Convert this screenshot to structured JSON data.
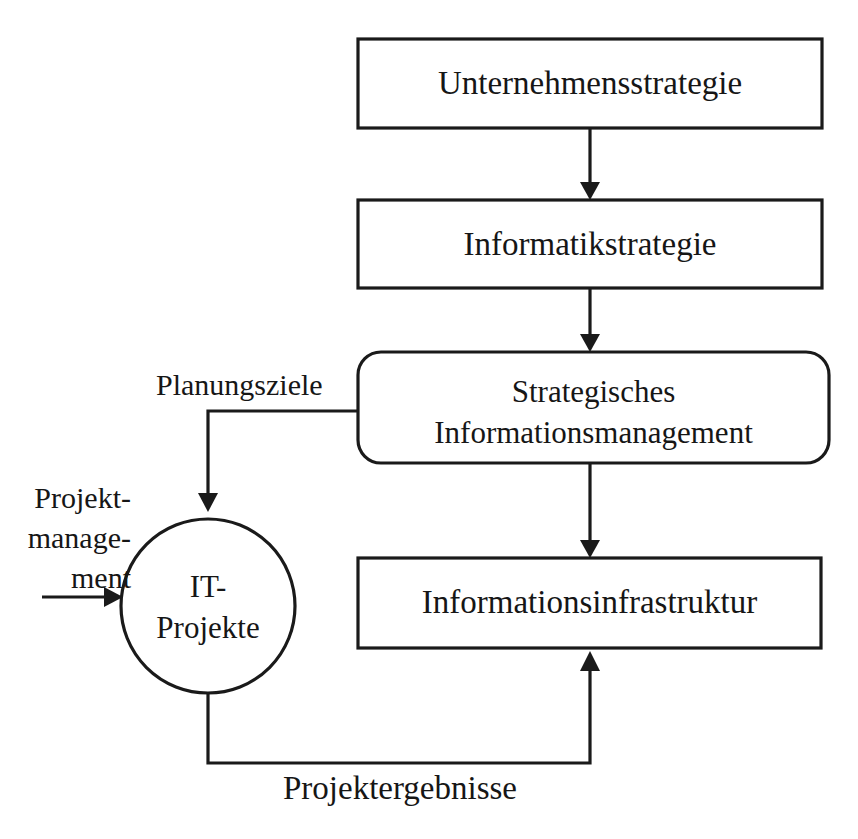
{
  "diagram": {
    "stroke_color": "#1a1a1a",
    "background_color": "#ffffff",
    "text_color": "#161616",
    "nodes": [
      {
        "id": "unternehmensstrategie",
        "shape": "rectangle",
        "label": "Unternehmensstrategie",
        "x": 358,
        "y": 39,
        "w": 464,
        "h": 89
      },
      {
        "id": "informatikstrategie",
        "shape": "rectangle",
        "label": "Informatikstrategie",
        "x": 358,
        "y": 200,
        "w": 464,
        "h": 88
      },
      {
        "id": "strategisches-informationsmanagement",
        "shape": "rounded-rectangle",
        "label_line1": "Strategisches",
        "label_line2": "Informationsmanagement",
        "x": 358,
        "y": 352,
        "w": 471,
        "h": 111
      },
      {
        "id": "informationsinfrastruktur",
        "shape": "rectangle",
        "label": "Informationsinfrastruktur",
        "x": 358,
        "y": 558,
        "w": 463,
        "h": 90
      },
      {
        "id": "it-projekte",
        "shape": "circle",
        "label_line1": "IT-",
        "label_line2": "Projekte",
        "cx": 208,
        "cy": 606,
        "r": 87
      }
    ],
    "edges": [
      {
        "id": "unternehmensstrategie-to-informatikstrategie",
        "from": "unternehmensstrategie",
        "to": "informatikstrategie",
        "label": ""
      },
      {
        "id": "informatikstrategie-to-sim",
        "from": "informatikstrategie",
        "to": "strategisches-informationsmanagement",
        "label": ""
      },
      {
        "id": "sim-to-informationsinfrastruktur",
        "from": "strategisches-informationsmanagement",
        "to": "informationsinfrastruktur",
        "label": ""
      },
      {
        "id": "sim-to-it-projekte",
        "from": "strategisches-informationsmanagement",
        "to": "it-projekte",
        "label": "Planungsziele"
      },
      {
        "id": "it-projekte-to-informationsinfrastruktur",
        "from": "it-projekte",
        "to": "informationsinfrastruktur",
        "label": "Projektergebnisse"
      },
      {
        "id": "projektmanagement-to-it-projekte",
        "from": "projektmanagement",
        "to": "it-projekte",
        "label_line1": "Projekt-",
        "label_line2": "manage-",
        "label_line3": "ment"
      }
    ]
  }
}
